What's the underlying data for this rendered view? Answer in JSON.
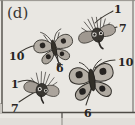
{
  "figure": {
    "panel_label": "(d)",
    "background_color": "#e9e7e2",
    "frame_color": "#5d5a55",
    "ink_color": "#2c2a28",
    "caption_note": ""
  },
  "specimens": [
    {
      "id": "moth-top-right",
      "name": "moth-top-right",
      "type": "moth",
      "cx": 97,
      "cy": 33,
      "rotation": -18,
      "scale": 0.72,
      "wing_fill": "#b9b3ab",
      "body_fill": "#3b3833",
      "eyespots": 2
    },
    {
      "id": "butterfly-center-left",
      "name": "butterfly-center-left",
      "type": "butterfly",
      "cx": 54,
      "cy": 48,
      "rotation": -12,
      "scale": 0.82,
      "wing_fill": "#bdb7ae",
      "body_fill": "#36332e",
      "eyespots": 4
    },
    {
      "id": "moth-bottom-left",
      "name": "moth-bottom-left",
      "type": "moth",
      "cx": 42,
      "cy": 88,
      "rotation": 8,
      "scale": 0.7,
      "wing_fill": "#b5afa7",
      "body_fill": "#35322d",
      "eyespots": 2
    },
    {
      "id": "butterfly-bottom-right",
      "name": "butterfly-bottom-right",
      "type": "butterfly",
      "cx": 92,
      "cy": 80,
      "rotation": -8,
      "scale": 1.0,
      "wing_fill": "#b8b2a9",
      "body_fill": "#35322d",
      "eyespots": 4
    }
  ],
  "annotations": [
    {
      "id": "ann-1-top",
      "name": "annotation-1-top-right",
      "text": "1",
      "x": 114,
      "y": 4,
      "target": "moth-top-right"
    },
    {
      "id": "ann-7-top",
      "name": "annotation-7-top-right",
      "text": "7",
      "x": 119,
      "y": 23,
      "target": "moth-top-right"
    },
    {
      "id": "ann-10-left",
      "name": "annotation-10-center-left",
      "text": "10",
      "x": 9,
      "y": 51,
      "target": "butterfly-center-left"
    },
    {
      "id": "ann-6-center",
      "name": "annotation-6-center-left",
      "text": "6",
      "x": 56,
      "y": 63,
      "target": "butterfly-center-left"
    },
    {
      "id": "ann-1-left",
      "name": "annotation-1-bottom-left",
      "text": "1",
      "x": 11,
      "y": 79,
      "target": "moth-bottom-left"
    },
    {
      "id": "ann-7-left",
      "name": "annotation-7-bottom-left",
      "text": "7",
      "x": 11,
      "y": 103,
      "target": "moth-bottom-left"
    },
    {
      "id": "ann-10-right",
      "name": "annotation-10-bottom-right",
      "text": "10",
      "x": 118,
      "y": 57,
      "target": "butterfly-bottom-right"
    },
    {
      "id": "ann-6-bottom",
      "name": "annotation-6-bottom-right",
      "text": "6",
      "x": 84,
      "y": 108,
      "target": "butterfly-bottom-right"
    }
  ],
  "leader_lines": [
    {
      "name": "leader-1-top-right",
      "d": "M 113 11 C 108 14 101 17 95 23"
    },
    {
      "name": "leader-7-top-right",
      "d": "M 117 27 C 112 28 106 30 101 34"
    },
    {
      "name": "leader-10-center-left",
      "d": "M 20 52 C 29 46 38 44 47 45"
    },
    {
      "name": "leader-6-center-left",
      "d": "M 58 61 C 58 57 57 54 56 51"
    },
    {
      "name": "leader-1-bottom-left",
      "d": "M 18 82 C 26 79 33 80 38 84"
    },
    {
      "name": "leader-7-bottom-left",
      "d": "M 19 102 C 25 98 31 94 37 91"
    },
    {
      "name": "leader-10-bottom-right",
      "d": "M 115 60 C 108 60 101 63 95 68"
    },
    {
      "name": "leader-6-bottom-right",
      "d": "M 86 105 C 88 99 90 93 92 88"
    }
  ],
  "frame": {
    "name": "panel-frame",
    "left": 2,
    "top": 1,
    "right": 133,
    "bottom": 112,
    "tick_x": 62,
    "tick_bottom": 125
  }
}
